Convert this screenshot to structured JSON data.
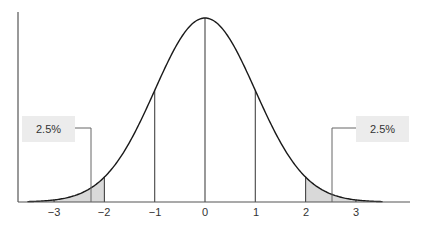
{
  "chart_data": {
    "type": "area",
    "title": "",
    "subtitle": "",
    "xlabel": "",
    "ylabel": "",
    "x_ticks": [
      -3,
      -2,
      -1,
      0,
      1,
      2,
      3
    ],
    "x_tick_labels": [
      "−3",
      "−2",
      "−1",
      "0",
      "1",
      "2",
      "3"
    ],
    "xlim": [
      -3.5,
      3.5
    ],
    "grid": false,
    "legend": null,
    "vertical_lines_at": [
      -3,
      -2,
      -1,
      0,
      1,
      2,
      3
    ],
    "shaded_regions": [
      {
        "from": -3.5,
        "to": -2,
        "label": "2.5%"
      },
      {
        "from": 2,
        "to": 3.5,
        "label": "2.5%"
      }
    ],
    "annotations": [
      {
        "text": "2.5%",
        "side": "left",
        "points_to_x": -2.3
      },
      {
        "text": "2.5%",
        "side": "right",
        "points_to_x": 2.5
      }
    ],
    "series": [
      {
        "name": "normal pdf",
        "mean": 0,
        "sd": 1
      }
    ],
    "colors": {
      "curve": "#1a1a1a",
      "axis": "#555555",
      "shade": "#d9d9d9",
      "label_bg": "#ececec"
    }
  },
  "annotations": {
    "left": "2.5%",
    "right": "2.5%"
  },
  "ticks": [
    "−3",
    "−2",
    "−1",
    "0",
    "1",
    "2",
    "3"
  ]
}
